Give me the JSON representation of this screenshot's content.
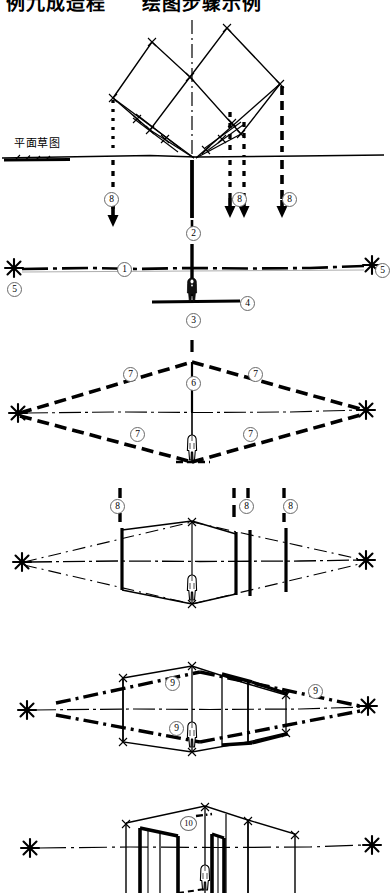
{
  "header": {
    "text_left": "例九成造程",
    "text_right": "绘图步骤示例",
    "note": "top title row is vertically clipped in the screenshot"
  },
  "labels": {
    "plan_sketch": "平面草图"
  },
  "colors": {
    "ink": "#000000",
    "paper": "#ffffff",
    "marker_ring": "#6a6a6a"
  },
  "panels": [
    {
      "id": "panel-1",
      "name": "plan-sketch-panel",
      "label": "平面草图",
      "markers": [
        {
          "value": "8",
          "x": 104,
          "y": 192
        },
        {
          "value": "2",
          "x": 186,
          "y": 226
        },
        {
          "value": "8",
          "x": 232,
          "y": 192
        },
        {
          "value": "8",
          "x": 282,
          "y": 192
        }
      ]
    },
    {
      "id": "panel-2",
      "name": "horizon-and-figure-panel",
      "markers": [
        {
          "value": "1",
          "x": 117,
          "y": 262
        },
        {
          "value": "2",
          "x": 186,
          "y": 230
        },
        {
          "value": "3",
          "x": 186,
          "y": 313
        },
        {
          "value": "4",
          "x": 240,
          "y": 300
        },
        {
          "value": "5",
          "x": 7,
          "y": 285
        },
        {
          "value": "5",
          "x": 375,
          "y": 268
        }
      ]
    },
    {
      "id": "panel-3",
      "name": "floor-plane-projection-panel",
      "markers": [
        {
          "value": "7",
          "x": 123,
          "y": 371
        },
        {
          "value": "6",
          "x": 186,
          "y": 381
        },
        {
          "value": "7",
          "x": 248,
          "y": 371
        },
        {
          "value": "7",
          "x": 130,
          "y": 431
        },
        {
          "value": "7",
          "x": 243,
          "y": 431
        }
      ]
    },
    {
      "id": "panel-4",
      "name": "vertical-edges-panel",
      "markers": [
        {
          "value": "8",
          "x": 110,
          "y": 500
        },
        {
          "value": "8",
          "x": 239,
          "y": 500
        },
        {
          "value": "8",
          "x": 283,
          "y": 500
        }
      ]
    },
    {
      "id": "panel-5",
      "name": "roof-lines-panel",
      "markers": [
        {
          "value": "9",
          "x": 165,
          "y": 680
        },
        {
          "value": "9",
          "x": 308,
          "y": 688
        },
        {
          "value": "9",
          "x": 169,
          "y": 725
        }
      ]
    },
    {
      "id": "panel-6",
      "name": "final-building-panel",
      "markers": [
        {
          "value": "10",
          "x": 182,
          "y": 820
        }
      ]
    }
  ],
  "figure_count": 5,
  "vanishing_points": [
    {
      "panel": "panel-2",
      "side": "left",
      "x": 14,
      "y": 268
    },
    {
      "panel": "panel-2",
      "side": "right",
      "x": 372,
      "y": 265
    },
    {
      "panel": "panel-3",
      "side": "left",
      "x": 18,
      "y": 413
    },
    {
      "panel": "panel-3",
      "side": "right",
      "x": 366,
      "y": 410
    },
    {
      "panel": "panel-4",
      "side": "left",
      "x": 22,
      "y": 562
    },
    {
      "panel": "panel-4",
      "side": "right",
      "x": 366,
      "y": 560
    },
    {
      "panel": "panel-5",
      "side": "left",
      "x": 27,
      "y": 710
    },
    {
      "panel": "panel-5",
      "side": "right",
      "x": 368,
      "y": 706
    },
    {
      "panel": "panel-6",
      "side": "left",
      "x": 30,
      "y": 848
    },
    {
      "panel": "panel-6",
      "side": "right",
      "x": 372,
      "y": 845
    }
  ]
}
